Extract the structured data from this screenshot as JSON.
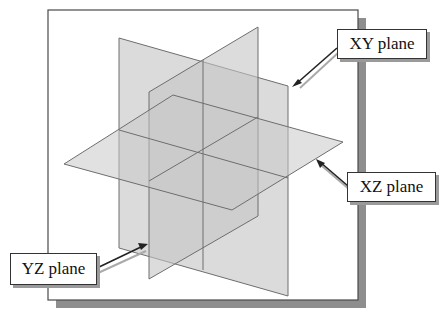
{
  "diagram": {
    "colors": {
      "background": "#ffffff",
      "frame_border": "#4a4a4a",
      "frame_shadow": "#8e8e8e",
      "plane_fill": "#c8c8c8",
      "plane_edge": "#6e6e6e",
      "arrow": "#222222"
    },
    "planes": [
      {
        "name": "XY plane",
        "label": "XY plane"
      },
      {
        "name": "XZ plane",
        "label": "XZ plane"
      },
      {
        "name": "YZ plane",
        "label": "YZ plane"
      }
    ]
  },
  "callouts": {
    "xy": "XY plane",
    "xz": "XZ plane",
    "yz": "YZ plane"
  }
}
